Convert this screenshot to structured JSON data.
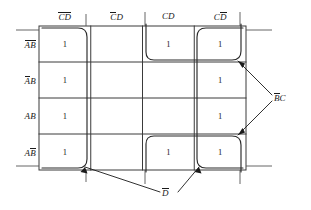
{
  "diagram": {
    "type": "karnaugh-map",
    "title": "",
    "grid": {
      "rows": 4,
      "cols": 4,
      "column_headers": [
        {
          "id": "c0",
          "text": "CD",
          "overbar": "both",
          "meaning": "C-bar D-bar"
        },
        {
          "id": "c1",
          "text": "CD",
          "overbar": "first",
          "meaning": "C-bar D"
        },
        {
          "id": "c2",
          "text": "CD",
          "overbar": "none",
          "meaning": "C D"
        },
        {
          "id": "c3",
          "text": "CD",
          "overbar": "second",
          "meaning": "C D-bar"
        }
      ],
      "row_headers": [
        {
          "id": "r0",
          "text": "AB",
          "overbar": "both",
          "meaning": "A-bar B-bar"
        },
        {
          "id": "r1",
          "text": "AB",
          "overbar": "first",
          "meaning": "A-bar B"
        },
        {
          "id": "r2",
          "text": "AB",
          "overbar": "none",
          "meaning": "A B"
        },
        {
          "id": "r3",
          "text": "AB",
          "overbar": "second",
          "meaning": "A B-bar"
        }
      ],
      "cells": [
        [
          "1",
          "",
          "1",
          "1"
        ],
        [
          "1",
          "",
          "",
          "1"
        ],
        [
          "1",
          "",
          "",
          "1"
        ],
        [
          "1",
          "",
          "1",
          "1"
        ]
      ]
    },
    "groups": [
      {
        "id": "g-dbar-left",
        "label": "D",
        "overbar": "first",
        "meaning": "D-bar",
        "covers": "column C-bar D-bar, all four rows"
      },
      {
        "id": "g-dbar-right",
        "label": "D",
        "overbar": "first",
        "meaning": "D-bar",
        "covers": "column C D-bar, all four rows"
      },
      {
        "id": "g-bbarc-top",
        "label": "BC",
        "overbar": "first",
        "meaning": "B-bar C",
        "covers": "row A-bar B-bar, columns CD and C D-bar"
      },
      {
        "id": "g-bbarc-bottom",
        "label": "BC",
        "overbar": "first",
        "meaning": "B-bar C",
        "covers": "row A B-bar, columns CD and C D-bar"
      }
    ],
    "annotations": [
      {
        "id": "annot-bbarc",
        "text": "BC",
        "overbar": "first",
        "meaning": "B-bar C",
        "position": "right"
      },
      {
        "id": "annot-dbar",
        "text": "D",
        "overbar": "first",
        "meaning": "D-bar",
        "position": "bottom"
      }
    ],
    "colors": {
      "ink": "#1a1a1a",
      "grid_line": "#3a3a3a",
      "loop_line": "#2a2a2a",
      "background": "#ffffff"
    }
  }
}
